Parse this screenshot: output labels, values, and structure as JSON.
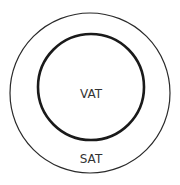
{
  "diagram": {
    "outer_circle": {
      "label": "SAT",
      "stroke": "#2a2a2a"
    },
    "inner_circle": {
      "label": "VAT",
      "stroke": "#1a1a1a"
    }
  }
}
